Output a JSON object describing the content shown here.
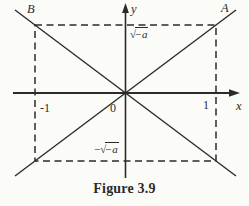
{
  "figure": {
    "caption": "Figure 3.9",
    "background": "#fbfbf8",
    "ink_color": "#2b2b2b"
  },
  "plot": {
    "points": {
      "b": "B",
      "a": "A"
    },
    "axes": {
      "x": "x",
      "y": "y"
    },
    "ticks": {
      "minus_one": "-1",
      "zero": "0",
      "one": "1"
    },
    "values": {
      "sqrt_symbol": "√",
      "sqrt_radicand": "−a",
      "minus_prefix": "−"
    }
  }
}
